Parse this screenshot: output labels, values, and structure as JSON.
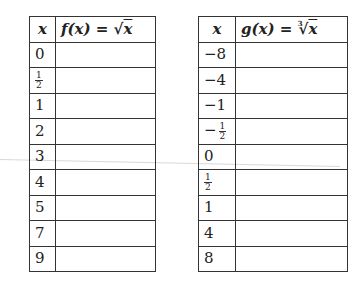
{
  "table_f": {
    "header_x": "x",
    "header_fx_prefix": "f(x) = ",
    "header_fx_radical": "√",
    "header_fx_radicand": "x",
    "rows": [
      {
        "x": "0",
        "value": ""
      },
      {
        "x_num": "1",
        "x_den": "2",
        "value": ""
      },
      {
        "x": "1",
        "value": ""
      },
      {
        "x": "2",
        "value": ""
      },
      {
        "x": "3",
        "value": ""
      },
      {
        "x": "4",
        "value": ""
      },
      {
        "x": "5",
        "value": ""
      },
      {
        "x": "7",
        "value": ""
      },
      {
        "x": "9",
        "value": ""
      }
    ]
  },
  "table_g": {
    "header_x": "x",
    "header_gx_prefix": "g(x) = ",
    "header_gx_index": "3",
    "header_gx_radical": "√",
    "header_gx_radicand": "x",
    "rows": [
      {
        "x": "−8",
        "value": ""
      },
      {
        "x": "−4",
        "value": ""
      },
      {
        "x": "−1",
        "value": ""
      },
      {
        "sign": "−",
        "x_num": "1",
        "x_den": "2",
        "value": ""
      },
      {
        "x": "0",
        "value": ""
      },
      {
        "x_num": "1",
        "x_den": "2",
        "value": ""
      },
      {
        "x": "1",
        "value": ""
      },
      {
        "x": "4",
        "value": ""
      },
      {
        "x": "8",
        "value": ""
      }
    ]
  }
}
